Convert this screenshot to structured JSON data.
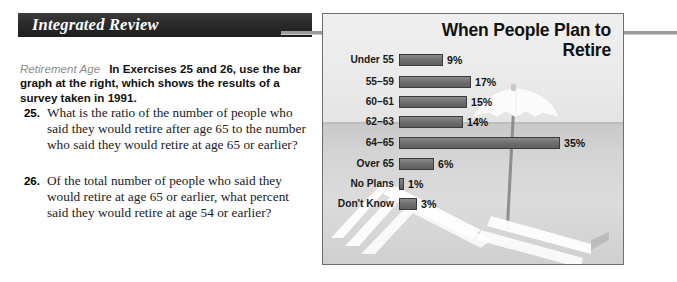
{
  "section": {
    "header_title": "Integrated Review",
    "topic_label": "Retirement Age",
    "intro_text": "In Exercises 25 and 26, use the bar graph at the right, which shows the results of a survey taken in 1991."
  },
  "exercises": [
    {
      "number": "25.",
      "text": "What is the ratio of the number of people who said they would retire after age 65 to the number who said they would retire at age 65 or earlier?"
    },
    {
      "number": "26.",
      "text": "Of the total number of people who said they would retire at age 65 or earlier, what percent said they would retire at age 54 or earlier?"
    }
  ],
  "chart_data": {
    "type": "bar",
    "title": "When People Plan to Retire",
    "orientation": "horizontal",
    "xlabel": "",
    "ylabel": "",
    "grid": false,
    "legend": "none",
    "xlim": [
      0,
      35
    ],
    "categories": [
      "Under 55",
      "55–59",
      "60–61",
      "62–63",
      "64–65",
      "Over 65",
      "No Plans",
      "Don't Know"
    ],
    "values": [
      9,
      17,
      15,
      14,
      35,
      6,
      1,
      3
    ],
    "value_labels": [
      "9%",
      "17%",
      "15%",
      "14%",
      "35%",
      "6%",
      "1%",
      "3%"
    ],
    "bar_pixel_widths": [
      44,
      72,
      68,
      64,
      161,
      35,
      5,
      18
    ],
    "bar_color": "#6e6e6e",
    "bar_outline": "#3b3b3b",
    "background_scene": "beach-umbrella-and-lounge-chairs"
  }
}
